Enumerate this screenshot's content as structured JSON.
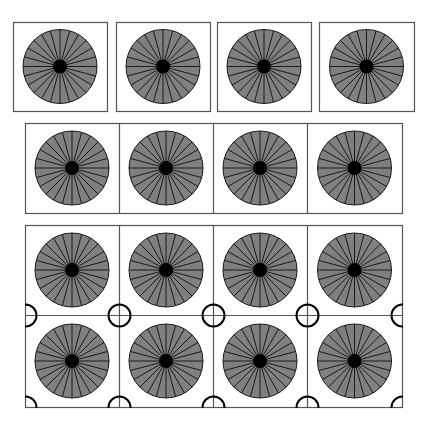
{
  "figure": {
    "width": 431,
    "height": 428,
    "colors": {
      "background": "#ffffff",
      "frame": "#555555",
      "wheel_fill": "#808080",
      "wheel_stroke": "#1a1a1a",
      "hub": "#000000",
      "ring": "#000000"
    },
    "wheel": {
      "radius": 37,
      "hub_radius": 7,
      "spokes": 24
    },
    "ring_radius": 11
  },
  "rows": [
    {
      "name": "separate-tiles",
      "boxes": [
        {
          "x": 13,
          "y": 22,
          "w": 94,
          "h": 89
        },
        {
          "x": 116,
          "y": 22,
          "w": 94,
          "h": 89
        },
        {
          "x": 217,
          "y": 22,
          "w": 94,
          "h": 89
        },
        {
          "x": 319,
          "y": 22,
          "w": 95,
          "h": 89
        }
      ]
    },
    {
      "name": "joined-strip",
      "frame": {
        "x": 25,
        "y": 123,
        "w": 377,
        "h": 90
      },
      "dividers_x": [
        119,
        213,
        307
      ]
    },
    {
      "name": "grid-with-rings",
      "frame": {
        "x": 25,
        "y": 225,
        "w": 377,
        "h": 182
      },
      "dividers_x": [
        119,
        213,
        307
      ],
      "dividers_y": [
        315
      ],
      "rows": 2,
      "cols": 4
    }
  ]
}
